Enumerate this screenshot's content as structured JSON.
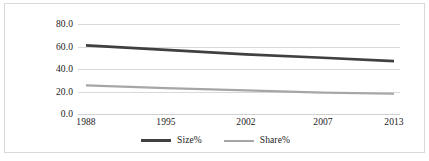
{
  "chart_data": {
    "type": "line",
    "title": "",
    "subtitle": "",
    "xlabel": "",
    "ylabel": "",
    "categories": [
      "1988",
      "1995",
      "2002",
      "2007",
      "2013"
    ],
    "x": [
      1988,
      1995,
      2002,
      2007,
      2013
    ],
    "series": [
      {
        "name": "Size%",
        "color": "#404040",
        "values": [
          61.0,
          57.0,
          53.0,
          50.0,
          47.0
        ]
      },
      {
        "name": "Share%",
        "color": "#a6a6a6",
        "values": [
          25.5,
          23.0,
          21.0,
          19.0,
          18.0
        ]
      }
    ],
    "ylim": [
      0.0,
      80.0
    ],
    "y_ticks": [
      0.0,
      20.0,
      40.0,
      60.0,
      80.0
    ],
    "y_tick_labels": [
      "0.0",
      "20.0",
      "40.0",
      "60.0",
      "80.0"
    ],
    "x_tick_labels": [
      "1988",
      "1995",
      "2002",
      "2007",
      "2013"
    ],
    "grid": true,
    "grid_axis": "y",
    "legend": true,
    "legend_position": "bottom",
    "legend_entries": [
      "Size%",
      "Share%"
    ],
    "annotations": []
  },
  "colors": {
    "background": "#ffffff",
    "frame_border": "#d8d8d8",
    "gridline": "#d9d9d9",
    "text": "#1a1a1a",
    "series_size": "#404040",
    "series_share": "#a6a6a6"
  }
}
